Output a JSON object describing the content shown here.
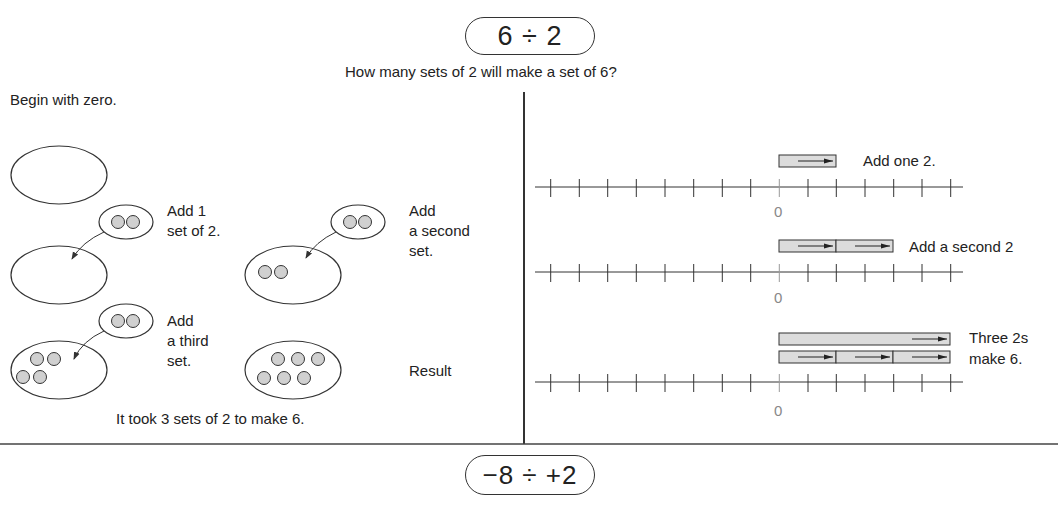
{
  "title_expression": "6 ÷ 2",
  "question": "How many sets of 2 will make a set of 6?",
  "left_panel": {
    "heading": "Begin with zero.",
    "steps": [
      {
        "label": "Add 1\nset of 2.",
        "counters_in_set": 0,
        "counters_added": 2
      },
      {
        "label": "Add\na second\nset.",
        "counters_in_set": 2,
        "counters_added": 2
      },
      {
        "label": "Add\na third\nset.",
        "counters_in_set": 4,
        "counters_added": 2
      },
      {
        "label": "Result",
        "counters_in_set": 6
      }
    ],
    "conclusion": "It took 3 sets of 2 to make 6."
  },
  "right_panel": {
    "number_lines": [
      {
        "label": "Add one 2.",
        "zero_label": "0",
        "jumps": 1,
        "jump_size": 2
      },
      {
        "label": "Add a second 2",
        "zero_label": "0",
        "jumps": 2,
        "jump_size": 2
      },
      {
        "label": "Three 2s\nmake 6.",
        "zero_label": "0",
        "jumps": 3,
        "jump_size": 2,
        "total_bar": 6
      }
    ],
    "tick_count": 15,
    "zero_tick_index": 8
  },
  "next_expression": "−8 ÷ +2",
  "colors": {
    "line": "#333333",
    "counter_fill": "#d0d0d0",
    "bar_fill": "#dcdcdc",
    "zero_label": "#888888"
  }
}
